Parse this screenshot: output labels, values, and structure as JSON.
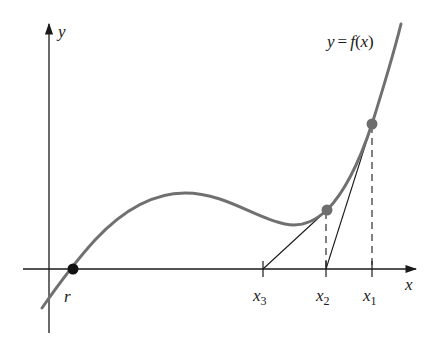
{
  "diagram": {
    "curve_label": "y = f(x)",
    "curve_label_parts": {
      "lhs": "y",
      "eq": "=",
      "f": "f",
      "open": "(",
      "x": "x",
      "close": ")"
    },
    "axes": {
      "x_label": "x",
      "y_label": "y"
    },
    "root": {
      "label": "r"
    },
    "points": [
      {
        "id": "x1",
        "label": "x",
        "subscript": "1"
      },
      {
        "id": "x2",
        "label": "x",
        "subscript": "2"
      },
      {
        "id": "x3",
        "label": "x",
        "subscript": "3"
      }
    ],
    "colors": {
      "curve": "#707070",
      "point": "#6e6e6e",
      "root_point": "#111111",
      "axes": "#1a1a1a",
      "tangent": "#1a1a1a",
      "dashed": "#1a1a1a"
    }
  }
}
